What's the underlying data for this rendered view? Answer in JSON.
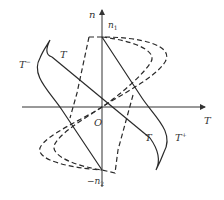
{
  "figure": {
    "axes": {
      "vertical_label": "n",
      "horizontal_label": "T",
      "origin_label": "O"
    },
    "points": {
      "top_speed_label": "n",
      "top_speed_sub": "1",
      "bottom_speed_label": "−n",
      "bottom_speed_sub": "2"
    },
    "curves": {
      "torque_line_label": "T",
      "torque_line_label_lower": "T",
      "positive_curve_label": "T",
      "positive_curve_sup": "+",
      "negative_curve_label": "T",
      "negative_curve_sup": "−"
    },
    "colors": {
      "stroke": "#2a2a2a",
      "background": "#ffffff"
    }
  }
}
